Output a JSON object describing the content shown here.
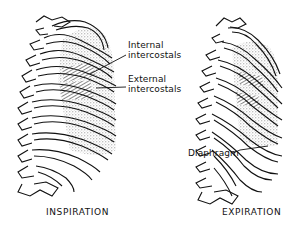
{
  "figure": {
    "panels": [
      {
        "id": "inspiration",
        "caption": "INSPIRATION",
        "labels": [
          {
            "line1": "Internal",
            "line2": "intercostals"
          },
          {
            "line1": "External",
            "line2": "intercostals"
          }
        ]
      },
      {
        "id": "expiration",
        "caption": "EXPIRATION",
        "labels": [
          {
            "line1": "Diaphragm"
          }
        ]
      }
    ],
    "colors": {
      "ink": "#111111",
      "background": "#ffffff",
      "stipple": "#9a9a9a"
    }
  }
}
